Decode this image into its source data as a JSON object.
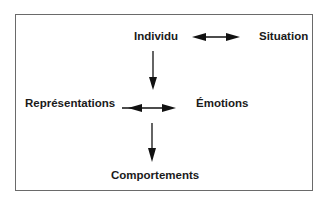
{
  "diagram": {
    "nodes": {
      "individu": "Individu",
      "situation": "Situation",
      "representations": "Représentations",
      "emotions": "Émotions",
      "comportements": "Comportements"
    },
    "edges": [
      {
        "from": "individu",
        "to": "situation",
        "type": "bidirectional"
      },
      {
        "from": "individu",
        "to": "representations-emotions",
        "type": "directed"
      },
      {
        "from": "representations",
        "to": "emotions",
        "type": "bidirectional"
      },
      {
        "from": "representations-emotions",
        "to": "comportements",
        "type": "directed"
      }
    ],
    "colors": {
      "text": "#1a1a1a",
      "border": "#6a6a6a",
      "arrow": "#111111"
    }
  }
}
